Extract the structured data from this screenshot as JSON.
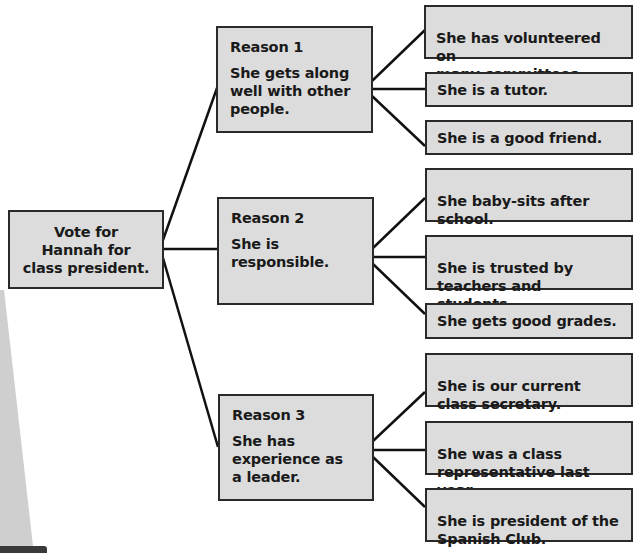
{
  "diagram": {
    "root": {
      "text": "Vote for\nHannah for\nclass president."
    },
    "reasons": [
      {
        "title": "Reason 1",
        "text": "She gets along\nwell with other\npeople.",
        "details": [
          "She has volunteered on\nmany committees.",
          "She is a tutor.",
          "She is a good friend."
        ]
      },
      {
        "title": "Reason 2",
        "text": "She is responsible.",
        "details": [
          "She baby-sits after\nschool.",
          "She is trusted by\nteachers and students.",
          "She gets good grades."
        ]
      },
      {
        "title": "Reason 3",
        "text": "She has\nexperience as\na leader.",
        "details": [
          "She is our current\nclass secretary.",
          "She was a class\nrepresentative last year.",
          "She is president of the\nSpanish Club."
        ]
      }
    ],
    "colors": {
      "box_fill": "#dcdcdc",
      "box_border": "#2a2a2a",
      "connector": "#111111",
      "text": "#1a1a1a"
    }
  }
}
